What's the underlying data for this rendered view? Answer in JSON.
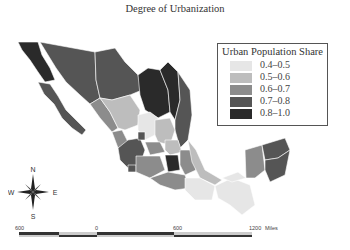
{
  "title": "Degree of Urbanization",
  "legend": {
    "title": "Urban Population Share",
    "items": [
      {
        "label": "0.4–0.5",
        "color": "#e6e6e6"
      },
      {
        "label": "0.5–0.6",
        "color": "#bdbdbd"
      },
      {
        "label": "0.6–0.7",
        "color": "#8c8c8c"
      },
      {
        "label": "0.7–0.8",
        "color": "#555555"
      },
      {
        "label": "0.8–1.0",
        "color": "#2a2a2a"
      }
    ]
  },
  "compass": {
    "n": "N",
    "s": "S",
    "e": "E",
    "w": "W"
  },
  "scale_bar": {
    "ticks": [
      "600",
      "0",
      "600",
      "1200"
    ],
    "unit": "Miles"
  }
}
